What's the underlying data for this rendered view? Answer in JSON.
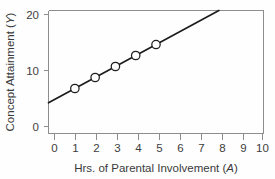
{
  "chart_data": {
    "type": "scatter",
    "title": "",
    "subtitle": "",
    "xlabel": "Hrs. of Parental Involvement (A)",
    "xlabel_text": "Hrs. of Parental Involvement (",
    "xlabel_var": "A",
    "xlabel_close": ")",
    "ylabel": "Concept Attainment (Y)",
    "ylabel_text": "Concept Attainment (",
    "ylabel_var": "Y",
    "ylabel_close": ")",
    "xlim": [
      -0.3,
      10.3
    ],
    "ylim": [
      -1.2,
      21.2
    ],
    "xticks": [
      0,
      1,
      2,
      3,
      4,
      5,
      6,
      7,
      8,
      9,
      10
    ],
    "xticklabels": [
      "0",
      "1",
      "2",
      "3",
      "4",
      "5",
      "6",
      "7",
      "8",
      "9",
      "10"
    ],
    "yticks": [
      0,
      10,
      20
    ],
    "yticklabels": [
      "0",
      "10",
      "20"
    ],
    "grid": false,
    "legend": null,
    "marker_style": "open-circle",
    "x": [
      1,
      2,
      3,
      4,
      5
    ],
    "values": [
      7,
      9,
      11,
      13,
      15
    ],
    "points": [
      {
        "x": 1,
        "y": 7
      },
      {
        "x": 2,
        "y": 9
      },
      {
        "x": 3,
        "y": 11
      },
      {
        "x": 4,
        "y": 13
      },
      {
        "x": 5,
        "y": 15
      }
    ],
    "fit_line": {
      "slope": 2,
      "intercept": 5,
      "x_start": -0.3,
      "x_end": 8.1,
      "y_start": 4.4,
      "y_end": 21.2
    },
    "colors": {
      "line": "#1c1c1c",
      "marker_fill": "#ffffff",
      "marker_stroke": "#1f1f1f",
      "axis": "#8d8d8d",
      "text": "#3a3a3a",
      "background": "#fefefe"
    }
  }
}
